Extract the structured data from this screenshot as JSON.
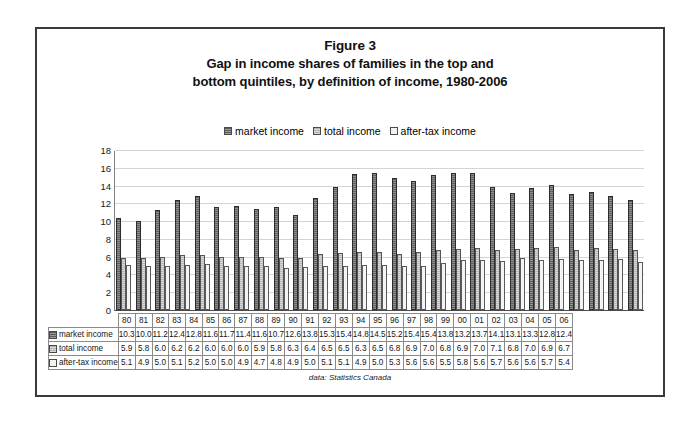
{
  "figure": {
    "title_label": "Figure 3",
    "title_line2": "Gap in income shares of families in the top and",
    "title_line3": "bottom quintiles, by definition of income, 1980-2006",
    "source_note": "data: Statistics Canada"
  },
  "legend": {
    "position": "top",
    "items": [
      {
        "label": "market income",
        "swatch_icon": "market-income-swatch-icon",
        "color": "#5f5f5f"
      },
      {
        "label": "total income",
        "swatch_icon": "total-income-swatch-icon",
        "color": "#b8b8b8"
      },
      {
        "label": "after-tax income",
        "swatch_icon": "after-tax-income-swatch-icon",
        "color": "#f4f4f4"
      }
    ]
  },
  "axis": {
    "yticks": [
      0,
      2,
      4,
      6,
      8,
      10,
      12,
      14,
      16,
      18
    ],
    "ymin": 0,
    "ymax": 18
  },
  "table": {
    "row_labels": [
      "market income",
      "total income",
      "after-tax income"
    ]
  },
  "chart_data": {
    "type": "bar",
    "title": "Gap in income shares of families in the top and bottom quintiles, by definition of income, 1980-2006",
    "xlabel": "",
    "ylabel": "",
    "ylim": [
      0,
      18
    ],
    "ytick_step": 2,
    "grid": true,
    "legend_position": "top",
    "categories": [
      "80",
      "81",
      "82",
      "83",
      "84",
      "85",
      "86",
      "87",
      "88",
      "89",
      "90",
      "91",
      "92",
      "93",
      "94",
      "95",
      "96",
      "97",
      "98",
      "99",
      "00",
      "01",
      "02",
      "03",
      "04",
      "05",
      "06"
    ],
    "series": [
      {
        "name": "market income",
        "color": "#5f5f5f",
        "values": [
          10.3,
          10.0,
          11.2,
          12.4,
          12.8,
          11.6,
          11.7,
          11.4,
          11.6,
          10.7,
          12.6,
          13.8,
          15.3,
          15.4,
          14.8,
          14.5,
          15.2,
          15.4,
          15.4,
          13.8,
          13.2,
          13.7,
          14.1,
          13.1,
          13.3,
          12.8,
          12.4
        ]
      },
      {
        "name": "total income",
        "color": "#b8b8b8",
        "values": [
          5.9,
          5.8,
          6.0,
          6.2,
          6.2,
          6.0,
          6.0,
          6.0,
          5.9,
          5.8,
          6.3,
          6.4,
          6.5,
          6.5,
          6.3,
          6.5,
          6.8,
          6.9,
          7.0,
          6.8,
          6.9,
          7.0,
          7.1,
          6.8,
          7.0,
          6.9,
          6.7
        ]
      },
      {
        "name": "after-tax income",
        "color": "#f4f4f4",
        "values": [
          5.1,
          4.9,
          5.0,
          5.1,
          5.2,
          5.0,
          5.0,
          4.9,
          4.7,
          4.8,
          4.9,
          5.0,
          5.1,
          5.1,
          4.9,
          5.0,
          5.3,
          5.6,
          5.6,
          5.5,
          5.8,
          5.6,
          5.7,
          5.6,
          5.6,
          5.7,
          5.4
        ]
      }
    ]
  }
}
